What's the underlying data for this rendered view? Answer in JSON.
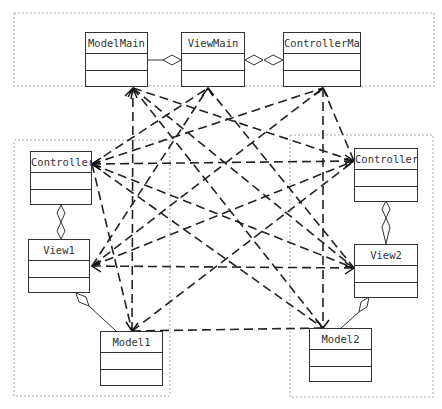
{
  "diagram": {
    "type": "UML class diagram (MVC hierarchy)",
    "groups": [
      {
        "id": "main",
        "classes": [
          "ModelMain",
          "ViewMain",
          "ControllerMain"
        ]
      },
      {
        "id": "group1",
        "classes": [
          "Controller1",
          "View1",
          "Model1"
        ]
      },
      {
        "id": "group2",
        "classes": [
          "Controller2",
          "View2",
          "Model2"
        ]
      }
    ],
    "classes": {
      "modelMain": "ModelMain",
      "viewMain": "ViewMain",
      "controllerMain": "ControllerMain",
      "controller1": "Controller1",
      "view1": "View1",
      "model1": "Model1",
      "controller2": "Controller2",
      "view2": "View2",
      "model2": "Model2"
    },
    "aggregations": [
      {
        "from": "ModelMain",
        "to": "ViewMain"
      },
      {
        "from": "ViewMain",
        "to": "ControllerMain",
        "bidirectional": true
      },
      {
        "from": "Controller1",
        "to": "View1",
        "bidirectional": true
      },
      {
        "from": "View1",
        "to": "Model1"
      },
      {
        "from": "Controller2",
        "to": "View2",
        "bidirectional": true
      },
      {
        "from": "View2",
        "to": "Model2"
      }
    ],
    "dependency_style": "dashed arrows between classes of different groups"
  }
}
